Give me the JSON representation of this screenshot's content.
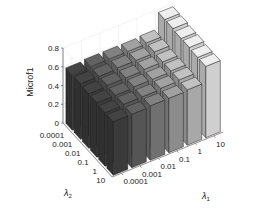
{
  "chart_data": {
    "type": "bar3d",
    "title": "",
    "zlabel": "Microf1",
    "xlabel": "λ1",
    "ylabel": "λ2",
    "x_categories": [
      "0.0001",
      "0.001",
      "0.01",
      "0.1",
      "1",
      "10"
    ],
    "y_categories": [
      "0.0001",
      "0.001",
      "0.01",
      "0.1",
      "1",
      "10"
    ],
    "zlim": [
      0,
      0.8
    ],
    "zticks": [
      "0",
      "0.2",
      "0.4",
      "0.6",
      "0.8"
    ],
    "grid": true,
    "values_note": "rows indexed by λ2 (0.0001..10), columns by λ1 (0.0001..10)",
    "values": [
      [
        0.59,
        0.6,
        0.6,
        0.6,
        0.61,
        0.78
      ],
      [
        0.59,
        0.59,
        0.6,
        0.6,
        0.61,
        0.78
      ],
      [
        0.58,
        0.59,
        0.59,
        0.6,
        0.6,
        0.77
      ],
      [
        0.58,
        0.58,
        0.59,
        0.59,
        0.6,
        0.77
      ],
      [
        0.57,
        0.58,
        0.58,
        0.59,
        0.6,
        0.76
      ],
      [
        0.57,
        0.57,
        0.58,
        0.58,
        0.59,
        0.76
      ]
    ],
    "column_colors": [
      "#3a3a3a",
      "#555555",
      "#707070",
      "#8c8c8c",
      "#a8a8a8",
      "#cfcfcf"
    ]
  },
  "axes": {
    "z_label": "Microf1",
    "x_label": "λ1",
    "y_label": "λ2"
  }
}
